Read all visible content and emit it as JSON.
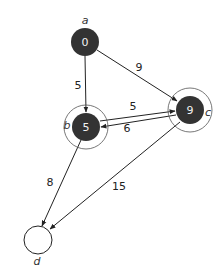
{
  "diagram": {
    "type": "weighted-directed-graph",
    "colors": {
      "visited_fill": "#333333",
      "unvisited_fill": "#ffffff",
      "node_text": "#f2f2f2",
      "edge": "#222222",
      "ring": "#555555"
    },
    "nodes": [
      {
        "id": "a",
        "name": "a",
        "value": "0",
        "visited": true,
        "ringed": false
      },
      {
        "id": "b",
        "name": "b",
        "value": "5",
        "visited": true,
        "ringed": true
      },
      {
        "id": "c",
        "name": "c",
        "value": "9",
        "visited": true,
        "ringed": true
      },
      {
        "id": "d",
        "name": "d",
        "value": "",
        "visited": false,
        "ringed": false
      }
    ],
    "edges": [
      {
        "from": "a",
        "to": "b",
        "weight": "5"
      },
      {
        "from": "a",
        "to": "c",
        "weight": "9"
      },
      {
        "from": "b",
        "to": "c",
        "weight": "5"
      },
      {
        "from": "c",
        "to": "b",
        "weight": "6"
      },
      {
        "from": "b",
        "to": "d",
        "weight": "8"
      },
      {
        "from": "c",
        "to": "d",
        "weight": "15"
      }
    ]
  }
}
